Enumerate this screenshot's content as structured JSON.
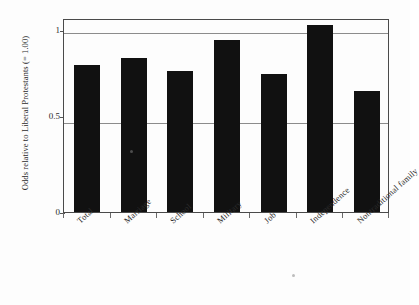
{
  "chart_data": {
    "type": "bar",
    "title": "",
    "subtitle": "",
    "xlabel": "",
    "ylabel": "Odds relative to Liberal Protestants (= 1.00)",
    "categories": [
      "Total",
      "Marriage",
      "School",
      "Military",
      "Job",
      "Independence",
      "Nontraditional family"
    ],
    "values": [
      0.81,
      0.85,
      0.78,
      0.95,
      0.76,
      1.03,
      0.67
    ],
    "ylim": [
      0,
      1.07
    ],
    "yticks": [
      "0",
      "0.5",
      "1"
    ],
    "ytick_values": [
      0,
      0.5,
      1
    ],
    "grid": true,
    "gridlines_at": [
      0.5,
      1
    ],
    "legend": "none",
    "bar_color": "#111111",
    "series": [
      {
        "name": "Odds ratio",
        "values": [
          0.81,
          0.85,
          0.78,
          0.95,
          0.76,
          1.03,
          0.67
        ]
      }
    ]
  },
  "axes": {
    "y_title": "Odds relative to Liberal Protestants (= 1.00)",
    "y_tick_labels": [
      "1",
      "0.5",
      "0"
    ],
    "x_tick_labels": [
      "Total",
      "Marriage",
      "School",
      "Military",
      "Job",
      "Independence",
      "Nontraditional family"
    ]
  },
  "colors": {
    "bar": "#111111",
    "frame": "#4a4a4a",
    "gridline": "#8c8c8c",
    "background": "#fdfdfd",
    "text": "#2b2b2b"
  }
}
